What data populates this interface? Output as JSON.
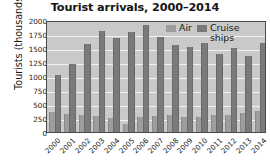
{
  "chart_data": {
    "type": "bar",
    "title": "Tourist arrivals, 2000–2014",
    "xlabel": "",
    "ylabel": "Tourists (thousands)",
    "ylim": [
      0,
      2000
    ],
    "ytick_labels": [
      "0",
      "250",
      "500",
      "750",
      "1000",
      "1250",
      "1500",
      "1750",
      "2000"
    ],
    "ytick_values": [
      0,
      250,
      500,
      750,
      1000,
      1250,
      1500,
      1750,
      2000
    ],
    "grid": true,
    "legend_position": "top-right",
    "categories": [
      "2000",
      "2001",
      "2002",
      "2003",
      "2004",
      "2005",
      "2006",
      "2007",
      "2008",
      "2009",
      "2010",
      "2011",
      "2012",
      "2013",
      "2014"
    ],
    "series": [
      {
        "name": "Air",
        "color": "#9d9d9d",
        "values": [
          350,
          320,
          300,
          290,
          255,
          150,
          260,
          290,
          295,
          265,
          275,
          305,
          310,
          335,
          375
        ]
      },
      {
        "name": "Cruise ships",
        "color": "#7a7a7a",
        "values": [
          1020,
          1210,
          1570,
          1800,
          1685,
          1785,
          1910,
          1705,
          1545,
          1510,
          1590,
          1395,
          1495,
          1360,
          1595
        ]
      }
    ]
  },
  "legend": {
    "entries": [
      {
        "label": "Air"
      },
      {
        "label": "Cruise ships"
      }
    ]
  },
  "colors": {
    "air": "#9d9d9d",
    "cruise": "#7a7a7a",
    "plot_background": "#c9c9c9",
    "gridline": "#f2f2f2",
    "axis": "#4a4a4a"
  }
}
